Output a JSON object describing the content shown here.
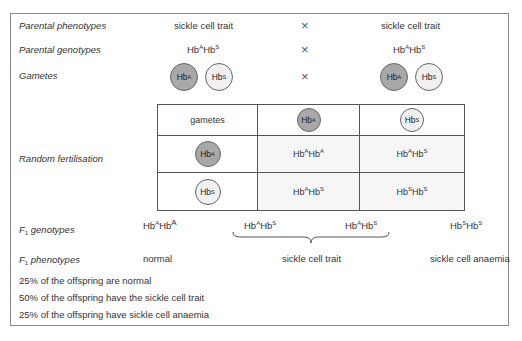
{
  "rows": {
    "parental_phenotypes": {
      "label": "Parental phenotypes",
      "left": "sickle cell trait",
      "cross": "×",
      "right": "sickle cell trait"
    },
    "parental_genotypes": {
      "label": "Parental genotypes",
      "left": {
        "a": "A",
        "b": "S"
      },
      "cross": "×",
      "right": {
        "a": "A",
        "b": "S"
      }
    },
    "gametes": {
      "label": "Gametes",
      "left": [
        "A",
        "S"
      ],
      "cross": "×",
      "right": [
        "A",
        "S"
      ]
    }
  },
  "gene_symbol": "Hb",
  "punnett": {
    "label": "Random fertilisation",
    "corner": "gametes",
    "col_headers": [
      "A",
      "S"
    ],
    "row_headers": [
      "A",
      "S"
    ],
    "cells": [
      [
        {
          "a": "A",
          "b": "A"
        },
        {
          "a": "A",
          "b": "S"
        }
      ],
      [
        {
          "a": "A",
          "b": "S"
        },
        {
          "a": "S",
          "b": "S"
        }
      ]
    ]
  },
  "f1_genotypes": {
    "label_prefix": "F",
    "label_sub": "1",
    "label_suffix": " genotypes",
    "items": [
      {
        "a": "A",
        "b": "A"
      },
      {
        "a": "A",
        "b": "S"
      },
      {
        "a": "A",
        "b": "S"
      },
      {
        "a": "S",
        "b": "S"
      }
    ]
  },
  "f1_phenotypes": {
    "label_prefix": "F",
    "label_sub": "1",
    "label_suffix": " phenotypes",
    "items": [
      "normal",
      "sickle cell trait",
      "sickle cell anaemia"
    ]
  },
  "summary": [
    "25% of the offspring are normal",
    "50% of the offspring have the sickle cell trait",
    "25% of the offspring have sickle cell anaemia"
  ],
  "colors": {
    "allele_A_fill": "#a8a8a8",
    "allele_S_fill": "#f0f0f0",
    "border": "#555555"
  }
}
